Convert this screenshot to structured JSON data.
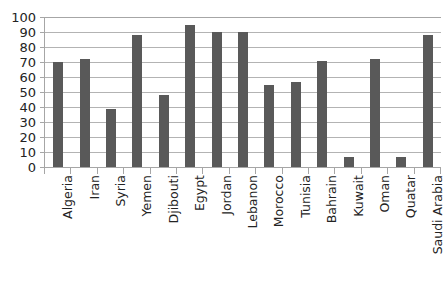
{
  "chart_data": {
    "type": "bar",
    "title": "",
    "subtitle": "",
    "xlabel": "",
    "ylabel": "",
    "ylim": [
      0,
      100
    ],
    "ytick_step": 10,
    "yticks": [
      "100",
      "90",
      "80",
      "70",
      "60",
      "50",
      "40",
      "30",
      "20",
      "10",
      "0"
    ],
    "grid": "horizontal",
    "legend": "none",
    "bar_color": "#595959",
    "gridline_color": "#b3b3b3",
    "axis_color": "#a6a6a6",
    "categories": [
      "Algeria",
      "Iran",
      "Syria",
      "Yemen",
      "Djibouti",
      "Egypt",
      "Jordan",
      "Lebanon",
      "Morocco",
      "Tunisia",
      "Bahrain",
      "Kuwait",
      "Oman",
      "Quatar",
      "Saudi Arabia"
    ],
    "values": [
      70,
      72,
      39,
      88,
      48,
      95,
      90,
      90,
      55,
      57,
      71,
      7,
      72,
      7,
      88
    ],
    "series": [
      {
        "name": "",
        "values": [
          70,
          72,
          39,
          88,
          48,
          95,
          90,
          90,
          55,
          57,
          71,
          7,
          72,
          7,
          88
        ]
      }
    ]
  }
}
